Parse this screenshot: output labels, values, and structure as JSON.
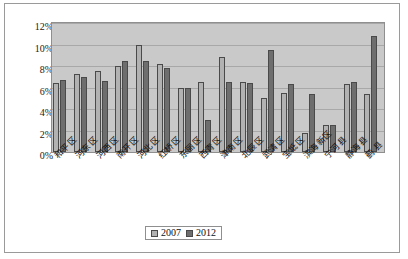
{
  "chart_data": {
    "type": "bar",
    "title": "",
    "xlabel": "",
    "ylabel": "",
    "ylim": [
      0,
      12
    ],
    "ytick_labels": [
      "12%",
      "10%",
      "8%",
      "6%",
      "4%",
      "2%",
      "0%"
    ],
    "ytick_values": [
      12,
      10,
      8,
      6,
      4,
      2,
      0
    ],
    "grid": true,
    "legend_position": "bottom-center",
    "categories": [
      "和平区",
      "河东区",
      "河西区",
      "南开区",
      "河北区",
      "红桥区",
      "东丽区",
      "西青区",
      "津南区",
      "北辰区",
      "武清区",
      "宝坻区",
      "滨海新区",
      "宁河县",
      "静海县",
      "蓟 县"
    ],
    "series": [
      {
        "name": "2007",
        "color": "#b2b2b2",
        "values": [
          6.4,
          7.3,
          7.5,
          8.0,
          10.0,
          8.2,
          6.0,
          6.5,
          8.8,
          6.5,
          5.0,
          5.5,
          1.8,
          2.5,
          6.3,
          5.4
        ]
      },
      {
        "name": "2012",
        "color": "#6e6e6e",
        "values": [
          6.7,
          7.0,
          6.6,
          8.5,
          8.5,
          7.8,
          6.0,
          3.0,
          6.5,
          6.4,
          9.5,
          6.3,
          5.4,
          2.5,
          6.5,
          10.8
        ]
      }
    ]
  },
  "legend": {
    "items": [
      {
        "label": "2007",
        "color": "#b2b2b2"
      },
      {
        "label": "2012",
        "color": "#6e6e6e"
      }
    ]
  }
}
